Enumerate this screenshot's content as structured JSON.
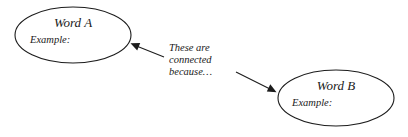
{
  "canvas": {
    "width": 408,
    "height": 137,
    "background_color": "#ffffff",
    "stroke_color": "#1c1c1c",
    "text_color": "#1a1a1a"
  },
  "nodes": [
    {
      "id": "word-a",
      "title": "Word A",
      "example_label": "Example:",
      "cx": 73,
      "cy": 35,
      "rx": 58,
      "ry": 28,
      "title_x": 73,
      "title_y": 27,
      "example_x": 30,
      "example_y": 43
    },
    {
      "id": "word-b",
      "title": "Word B",
      "example_label": "Example:",
      "cx": 336,
      "cy": 98,
      "rx": 58,
      "ry": 28,
      "title_x": 336,
      "title_y": 90,
      "example_x": 292,
      "example_y": 106
    }
  ],
  "caption": {
    "lines": [
      "These are",
      "connected",
      "because…"
    ],
    "x": 169,
    "line_y": [
      51,
      63,
      75
    ]
  },
  "arrows": [
    {
      "id": "arrow-to-word-a",
      "direction": "up-left",
      "tail_x": 164,
      "tail_y": 57,
      "tip_x": 131,
      "tip_y": 44
    },
    {
      "id": "arrow-to-word-b",
      "direction": "down-right",
      "tail_x": 236,
      "tail_y": 72,
      "tip_x": 276,
      "tip_y": 92
    }
  ]
}
